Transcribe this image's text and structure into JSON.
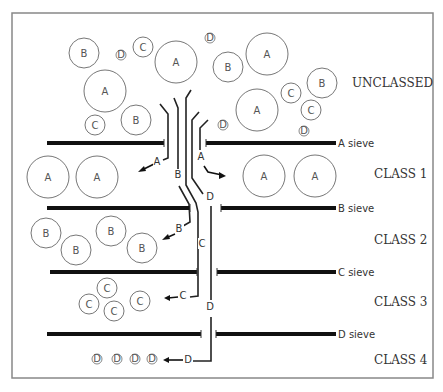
{
  "diagram": {
    "title": "",
    "frame": {
      "x": 12,
      "y": 13,
      "w": 421,
      "h": 365
    },
    "class_labels": [
      {
        "id": "unclassed",
        "text": "UNCLASSED",
        "x": 352,
        "y": 87
      },
      {
        "id": "class1",
        "text": "CLASS 1",
        "x": 374,
        "y": 178
      },
      {
        "id": "class2",
        "text": "CLASS 2",
        "x": 374,
        "y": 244
      },
      {
        "id": "class3",
        "text": "CLASS 3",
        "x": 374,
        "y": 306
      },
      {
        "id": "class4",
        "text": "CLASS 4",
        "x": 374,
        "y": 364
      }
    ],
    "sieves": [
      {
        "id": "a",
        "label": "A sieve",
        "y": 143,
        "left": [
          47,
          164
        ],
        "right": [
          206,
          336
        ],
        "label_x": 338
      },
      {
        "id": "b",
        "label": "B sieve",
        "y": 208,
        "left": [
          47,
          190
        ],
        "right": [
          221,
          336
        ],
        "label_x": 338
      },
      {
        "id": "c",
        "label": "C sieve",
        "y": 272,
        "left": [
          50,
          197
        ],
        "right": [
          217,
          336
        ],
        "label_x": 338
      },
      {
        "id": "d",
        "label": "D sieve",
        "y": 334,
        "left": [
          47,
          201
        ],
        "right": [
          216,
          336
        ],
        "label_x": 338
      }
    ],
    "particles": [
      {
        "label": "B",
        "cx": 84,
        "cy": 53,
        "r": 15,
        "group": "unclassed"
      },
      {
        "label": "D",
        "cx": 121,
        "cy": 55,
        "r": 5,
        "group": "unclassed"
      },
      {
        "label": "C",
        "cx": 143,
        "cy": 47,
        "r": 10,
        "group": "unclassed"
      },
      {
        "label": "A",
        "cx": 176,
        "cy": 62,
        "r": 21,
        "group": "unclassed"
      },
      {
        "label": "D",
        "cx": 210,
        "cy": 38,
        "r": 5,
        "group": "unclassed"
      },
      {
        "label": "B",
        "cx": 228,
        "cy": 67,
        "r": 15,
        "group": "unclassed"
      },
      {
        "label": "A",
        "cx": 267,
        "cy": 54,
        "r": 21,
        "group": "unclassed"
      },
      {
        "label": "A",
        "cx": 105,
        "cy": 91,
        "r": 21,
        "group": "unclassed"
      },
      {
        "label": "C",
        "cx": 95,
        "cy": 125,
        "r": 10,
        "group": "unclassed"
      },
      {
        "label": "B",
        "cx": 136,
        "cy": 120,
        "r": 15,
        "group": "unclassed"
      },
      {
        "label": "B",
        "cx": 322,
        "cy": 83,
        "r": 15,
        "group": "unclassed"
      },
      {
        "label": "C",
        "cx": 291,
        "cy": 93,
        "r": 10,
        "group": "unclassed"
      },
      {
        "label": "C",
        "cx": 311,
        "cy": 110,
        "r": 10,
        "group": "unclassed"
      },
      {
        "label": "A",
        "cx": 257,
        "cy": 110,
        "r": 21,
        "group": "unclassed"
      },
      {
        "label": "D",
        "cx": 223,
        "cy": 125,
        "r": 5,
        "group": "unclassed"
      },
      {
        "label": "D",
        "cx": 304,
        "cy": 131,
        "r": 5,
        "group": "unclassed"
      },
      {
        "label": "A",
        "cx": 48,
        "cy": 177,
        "r": 21,
        "group": "class1"
      },
      {
        "label": "A",
        "cx": 97,
        "cy": 177,
        "r": 21,
        "group": "class1"
      },
      {
        "label": "A",
        "cx": 264,
        "cy": 176,
        "r": 21,
        "group": "class1"
      },
      {
        "label": "A",
        "cx": 315,
        "cy": 176,
        "r": 21,
        "group": "class1"
      },
      {
        "label": "B",
        "cx": 46,
        "cy": 233,
        "r": 15,
        "group": "class2"
      },
      {
        "label": "B",
        "cx": 76,
        "cy": 250,
        "r": 15,
        "group": "class2"
      },
      {
        "label": "B",
        "cx": 111,
        "cy": 231,
        "r": 15,
        "group": "class2"
      },
      {
        "label": "B",
        "cx": 142,
        "cy": 248,
        "r": 15,
        "group": "class2"
      },
      {
        "label": "C",
        "cx": 107,
        "cy": 288,
        "r": 10,
        "group": "class3"
      },
      {
        "label": "C",
        "cx": 89,
        "cy": 304,
        "r": 10,
        "group": "class3"
      },
      {
        "label": "C",
        "cx": 114,
        "cy": 311,
        "r": 10,
        "group": "class3"
      },
      {
        "label": "C",
        "cx": 140,
        "cy": 301,
        "r": 10,
        "group": "class3"
      },
      {
        "label": "D",
        "cx": 97,
        "cy": 359,
        "r": 5,
        "group": "class4"
      },
      {
        "label": "D",
        "cx": 117,
        "cy": 359,
        "r": 5,
        "group": "class4"
      },
      {
        "label": "D",
        "cx": 135,
        "cy": 359,
        "r": 5,
        "group": "class4"
      },
      {
        "label": "D",
        "cx": 152,
        "cy": 359,
        "r": 5,
        "group": "class4"
      }
    ],
    "channel_labels": [
      {
        "text": "A",
        "x": 157,
        "y": 165
      },
      {
        "text": "A",
        "x": 201,
        "y": 160
      },
      {
        "text": "B",
        "x": 178,
        "y": 178
      },
      {
        "text": "D",
        "x": 210,
        "y": 200
      },
      {
        "text": "B",
        "x": 179,
        "y": 232
      },
      {
        "text": "C",
        "x": 202,
        "y": 247
      },
      {
        "text": "C",
        "x": 183,
        "y": 299
      },
      {
        "text": "D",
        "x": 210,
        "y": 310
      },
      {
        "text": "D",
        "x": 188,
        "y": 363
      }
    ]
  }
}
